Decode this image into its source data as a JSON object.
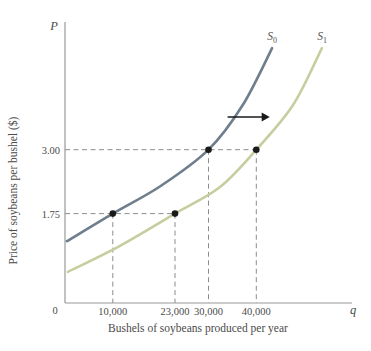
{
  "figure": {
    "y_axis_symbol": "P",
    "x_axis_symbol": "q",
    "origin_label": "0"
  },
  "chart_data": {
    "type": "line",
    "title": "",
    "xlabel": "Bushels of soybeans produced per year",
    "ylabel": "Price of soybeans per bushel ($)",
    "x_range": [
      0,
      60000
    ],
    "y_range": [
      0,
      5.5
    ],
    "grid": false,
    "legend_position": "curve-end-labels",
    "series": [
      {
        "name": "S0",
        "label_main": "S",
        "label_sub": "0",
        "color": "#6e7e8d",
        "points": [
          [
            400,
            1.21
          ],
          [
            10000,
            1.75
          ],
          [
            20000,
            2.29
          ],
          [
            30000,
            3.0
          ],
          [
            37200,
            3.88
          ],
          [
            43300,
            4.99
          ]
        ]
      },
      {
        "name": "S1",
        "label_main": "S",
        "label_sub": "1",
        "color": "#c6cd9e",
        "points": [
          [
            600,
            0.61
          ],
          [
            11500,
            1.12
          ],
          [
            23000,
            1.75
          ],
          [
            32400,
            2.27
          ],
          [
            40000,
            3.0
          ],
          [
            47700,
            3.88
          ],
          [
            53700,
            4.99
          ]
        ]
      }
    ],
    "marked_points": [
      {
        "q": 10000,
        "p": 1.75,
        "series": "S0"
      },
      {
        "q": 23000,
        "p": 1.75,
        "series": "S1"
      },
      {
        "q": 30000,
        "p": 3.0,
        "series": "S0"
      },
      {
        "q": 40000,
        "p": 3.0,
        "series": "S1"
      }
    ],
    "x_ticks": [
      {
        "value": 10000,
        "label": "10,000"
      },
      {
        "value": 23000,
        "label": "23,000"
      },
      {
        "value": 30000,
        "label": "30,000"
      },
      {
        "value": 40000,
        "label": "40,000"
      }
    ],
    "y_ticks": [
      {
        "value": 3.0,
        "label": "3.00"
      },
      {
        "value": 1.75,
        "label": "1.75"
      }
    ],
    "shift_arrow": {
      "from_q": 34000,
      "to_q": 42800,
      "at_p": 3.64
    },
    "colors": {
      "axis": "#999999",
      "dashed": "#8c8c8c",
      "marker": "#1a1a1a",
      "text": "#4a4a4a"
    }
  }
}
